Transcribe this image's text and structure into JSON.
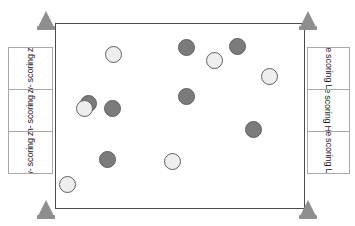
{
  "diagram": {
    "field": {
      "name": "playing-field",
      "x": 55,
      "y": 23,
      "width": 250,
      "height": 186,
      "border_color": "#4a4a4a",
      "fill_color": "#ffffff"
    },
    "cones": [
      {
        "name": "cone-top-left",
        "x": 46,
        "y": 14
      },
      {
        "name": "cone-top-right",
        "x": 308,
        "y": 14
      },
      {
        "name": "cone-bottom-left",
        "x": 46,
        "y": 203
      },
      {
        "name": "cone-bottom-right",
        "x": 308,
        "y": 203
      }
    ],
    "cone_color": "#8e8e8e",
    "left_zones": {
      "x": 8,
      "y": 47,
      "width": 45,
      "height": 127,
      "cells": [
        {
          "name": "zone-left-top",
          "lines": [
            "Low-",
            "scoring",
            "zone"
          ],
          "type": "low"
        },
        {
          "name": "zone-left-middle",
          "lines": [
            "High-",
            "scoring",
            "zone"
          ],
          "type": "high"
        },
        {
          "name": "zone-left-bottom",
          "lines": [
            "Low-",
            "scoring",
            "zone"
          ],
          "type": "low"
        }
      ]
    },
    "right_zones": {
      "x": 307,
      "y": 47,
      "width": 43,
      "height": 127,
      "cells": [
        {
          "name": "zone-right-top",
          "lines": [
            "Low-",
            "scoring",
            "zone"
          ],
          "type": "low"
        },
        {
          "name": "zone-right-middle",
          "lines": [
            "High-",
            "scoring",
            "zone"
          ],
          "type": "high"
        },
        {
          "name": "zone-right-bottom",
          "lines": [
            "Low-",
            "scoring",
            "zone"
          ],
          "type": "low"
        }
      ]
    },
    "disc_colors": {
      "dark": "#7b7b7b",
      "light": "#eeeeee",
      "outline": "#5f5f5f"
    },
    "discs": [
      {
        "name": "disc-light-1",
        "shade": "light",
        "cx": 113,
        "cy": 54,
        "r": 8.5
      },
      {
        "name": "disc-dark-1",
        "shade": "dark",
        "cx": 186,
        "cy": 47,
        "r": 8.5
      },
      {
        "name": "disc-light-2",
        "shade": "light",
        "cx": 214,
        "cy": 60,
        "r": 8.5
      },
      {
        "name": "disc-dark-2",
        "shade": "dark",
        "cx": 237,
        "cy": 46,
        "r": 8.5
      },
      {
        "name": "disc-light-3",
        "shade": "light",
        "cx": 269,
        "cy": 76,
        "r": 8.5
      },
      {
        "name": "disc-dark-3",
        "shade": "dark",
        "cx": 186,
        "cy": 96,
        "r": 8.5
      },
      {
        "name": "disc-dark-hidden",
        "shade": "dark",
        "cx": 88,
        "cy": 103,
        "r": 8.5
      },
      {
        "name": "disc-light-4",
        "shade": "light",
        "cx": 84,
        "cy": 108,
        "r": 8.5
      },
      {
        "name": "disc-dark-4",
        "shade": "dark",
        "cx": 112,
        "cy": 108,
        "r": 8.5
      },
      {
        "name": "disc-dark-5",
        "shade": "dark",
        "cx": 253,
        "cy": 129,
        "r": 8.5
      },
      {
        "name": "disc-dark-6",
        "shade": "dark",
        "cx": 107,
        "cy": 159,
        "r": 8.5
      },
      {
        "name": "disc-light-5",
        "shade": "light",
        "cx": 172,
        "cy": 161,
        "r": 8.5
      },
      {
        "name": "disc-light-6",
        "shade": "light",
        "cx": 67,
        "cy": 184,
        "r": 8.5
      }
    ]
  }
}
